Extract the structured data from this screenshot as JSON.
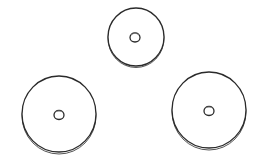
{
  "scene": {
    "background": "#ffffff",
    "stroke": "#2a2a2a",
    "rim": "#555555",
    "discs": [
      {
        "id": "top",
        "cx": 136,
        "cy": 37,
        "r": 28,
        "hole_r": 5
      },
      {
        "id": "bottom-left",
        "cx": 59,
        "cy": 114,
        "r": 37,
        "hole_r": 5
      },
      {
        "id": "bottom-right",
        "cx": 209,
        "cy": 110,
        "r": 37,
        "hole_r": 5
      }
    ]
  }
}
